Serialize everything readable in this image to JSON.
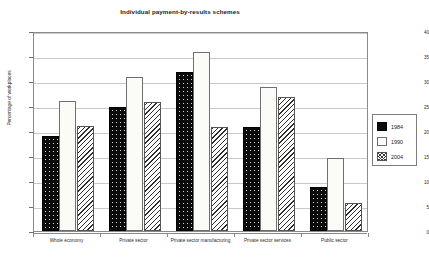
{
  "chart_data": {
    "type": "bar",
    "title": "Individual payment-by-results schemes",
    "xlabel": "",
    "ylabel": "Percentage of workplaces",
    "ylim": [
      0,
      40
    ],
    "yticks": [
      0,
      5,
      10,
      15,
      20,
      25,
      30,
      35,
      40
    ],
    "grid": true,
    "legend_position": "right",
    "categories": [
      "Whole economy",
      "Private sector",
      "Private sector manufacturing",
      "Private sector services",
      "Public sector"
    ],
    "series": [
      {
        "name": "1984",
        "values": [
          19.0,
          24.9,
          31.9,
          20.9,
          8.8
        ],
        "color": "#0b0b0b",
        "pattern": "solid-speckle"
      },
      {
        "name": "1990",
        "values": [
          26.0,
          30.9,
          35.8,
          28.8,
          14.7
        ],
        "color": "#fbfbf8",
        "pattern": "light-dotted"
      },
      {
        "name": "2004",
        "values": [
          21.0,
          25.8,
          20.9,
          26.8,
          5.7
        ],
        "color": "#ffffff",
        "pattern": "diagonal-hatch"
      }
    ]
  },
  "legend": {
    "items": [
      {
        "label": "1984"
      },
      {
        "label": "1990"
      },
      {
        "label": "2004"
      }
    ]
  }
}
